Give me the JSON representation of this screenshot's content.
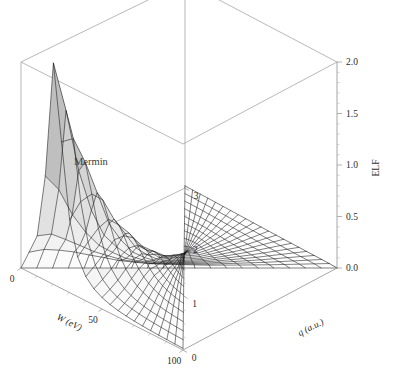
{
  "figure": {
    "annotation": "Mermin",
    "background_color": "#ffffff",
    "mesh_color": "#141414",
    "box_color": "#9a9a9a"
  },
  "chart_data": {
    "type": "surface",
    "title": "",
    "annotation": "Mermin",
    "xlabel": "W (eV)",
    "ylabel": "q (a.u.)",
    "zlabel": "ELF",
    "xlim": [
      0,
      100
    ],
    "ylim": [
      0,
      3
    ],
    "zlim": [
      0,
      2.0
    ],
    "xticks": [
      0,
      50,
      100
    ],
    "xticklabels": [
      "0",
      "50",
      "100"
    ],
    "yticks": [
      0,
      1,
      2,
      3
    ],
    "yticklabels": [
      "0",
      "1",
      "2",
      "3"
    ],
    "zticks": [
      0.0,
      0.5,
      1.0,
      1.5,
      2.0
    ],
    "zticklabels": [
      "0.0",
      "0.5",
      "1.0",
      "1.5",
      "2.0"
    ],
    "z_minor_step": 0.1,
    "grid": false,
    "legend": "none",
    "nx": 21,
    "ny": 21,
    "model": "mermin-elf",
    "plasmon_energy_eV": 20.0,
    "peak_elf_at_q0": 2.15,
    "ridge_profiles": [
      {
        "q": 0.0,
        "peak_W": 20,
        "peak_elf": 2.15,
        "width": 7
      },
      {
        "q": 0.15,
        "peak_W": 21,
        "peak_elf": 1.72,
        "width": 9
      },
      {
        "q": 0.3,
        "peak_W": 23,
        "peak_elf": 1.22,
        "width": 12
      },
      {
        "q": 0.45,
        "peak_W": 26,
        "peak_elf": 0.88,
        "width": 16
      },
      {
        "q": 0.6,
        "peak_W": 30,
        "peak_elf": 0.62,
        "width": 21
      },
      {
        "q": 0.9,
        "peak_W": 38,
        "peak_elf": 0.34,
        "width": 29
      },
      {
        "q": 1.2,
        "peak_W": 48,
        "peak_elf": 0.2,
        "width": 37
      },
      {
        "q": 1.8,
        "peak_W": 68,
        "peak_elf": 0.09,
        "width": 50
      },
      {
        "q": 2.4,
        "peak_W": 88,
        "peak_elf": 0.04,
        "width": 62
      },
      {
        "q": 3.0,
        "peak_W": 100,
        "peak_elf": 0.02,
        "width": 75
      }
    ]
  },
  "axes": {
    "z": {
      "label": "ELF",
      "ticklabels": [
        "0.0",
        "0.5",
        "1.0",
        "1.5",
        "2.0"
      ]
    },
    "x": {
      "label": "W (eV)",
      "ticklabels": [
        "0",
        "50",
        "100"
      ]
    },
    "y": {
      "label": "q (a.u.)",
      "ticklabels": [
        "0",
        "1",
        "2",
        "3"
      ]
    }
  }
}
